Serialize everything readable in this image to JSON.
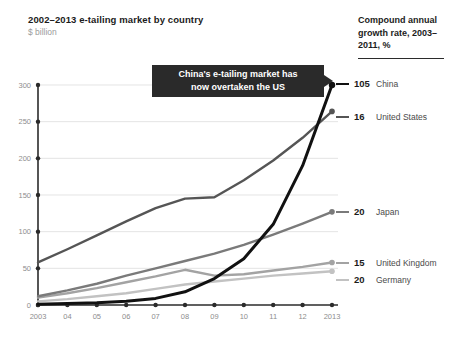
{
  "header": {
    "title": "2002–2013 e-tailing market by country",
    "subtitle": "$ billion",
    "cagr_heading": "Compound annual growth rate, 2003–2011, %"
  },
  "annotation": {
    "line1": "China's e-tailing market has",
    "line2": "now overtaken the US",
    "text": "China's e-tailing market has now overtaken the US",
    "background": "#2a2a2a",
    "color": "#ffffff"
  },
  "legend": [
    {
      "value": "105",
      "label": "China",
      "color": "#111111"
    },
    {
      "value": "16",
      "label": "United States",
      "color": "#555555"
    },
    {
      "value": "20",
      "label": "Japan",
      "color": "#7a7a7a"
    },
    {
      "value": "15",
      "label": "United Kingdom",
      "color": "#a3a3a3"
    },
    {
      "value": "20",
      "label": "Germany",
      "color": "#c2c2c2"
    }
  ],
  "chart_data": {
    "type": "line",
    "title": "2002–2013 e-tailing market by country",
    "subtitle": "$ billion",
    "xlabel": "",
    "ylabel": "$ billion",
    "ylim": [
      0,
      300
    ],
    "yticks": [
      0,
      50,
      100,
      150,
      200,
      250,
      300
    ],
    "ytick_labels": [
      "0",
      "50",
      "100",
      "150",
      "200",
      "250",
      "300"
    ],
    "grid": true,
    "legend_position": "right",
    "x": [
      2003,
      2004,
      2005,
      2006,
      2007,
      2008,
      2009,
      2010,
      2011,
      2012,
      2013
    ],
    "categories": [
      "2003",
      "04",
      "05",
      "06",
      "07",
      "08",
      "09",
      "10",
      "11",
      "12",
      "2013"
    ],
    "series": [
      {
        "name": "China",
        "color": "#111111",
        "cagr": 105,
        "values": [
          1,
          2,
          3,
          5,
          9,
          18,
          36,
          63,
          110,
          190,
          300
        ]
      },
      {
        "name": "United States",
        "color": "#555555",
        "cagr": 16,
        "values": [
          58,
          76,
          95,
          114,
          132,
          145,
          147,
          170,
          197,
          228,
          264
        ]
      },
      {
        "name": "Japan",
        "color": "#7a7a7a",
        "cagr": 20,
        "values": [
          12,
          20,
          29,
          40,
          50,
          60,
          70,
          82,
          96,
          111,
          127
        ]
      },
      {
        "name": "United Kingdom",
        "color": "#a3a3a3",
        "cagr": 15,
        "values": [
          10,
          16,
          23,
          31,
          39,
          48,
          40,
          42,
          47,
          52,
          58
        ]
      },
      {
        "name": "Germany",
        "color": "#c2c2c2",
        "cagr": 20,
        "values": [
          5,
          8,
          12,
          16,
          22,
          28,
          32,
          36,
          40,
          43,
          46
        ]
      }
    ]
  }
}
